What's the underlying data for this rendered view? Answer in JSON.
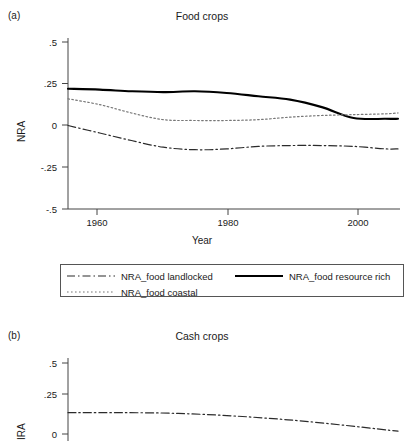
{
  "figure": {
    "panels": [
      {
        "letter": "(a)",
        "title": "Food crops",
        "ylabel": "NRA",
        "xlabel": "Year"
      },
      {
        "letter": "(b)",
        "title": "Cash crops",
        "ylabel": "IRA",
        "xlabel": ""
      }
    ]
  },
  "legend": {
    "entries": [
      {
        "label": "NRA_food landlocked",
        "style": "dash-dot",
        "color": "#2b2b2b"
      },
      {
        "label": "NRA_food resource rich",
        "style": "solid",
        "color": "#000000"
      },
      {
        "label": "NRA_food coastal",
        "style": "dotted",
        "color": "#777777"
      }
    ]
  },
  "axis_a": {
    "yticks": [
      ".5",
      ".25",
      "0",
      "-.25",
      "-.5"
    ],
    "xticks": [
      "1960",
      "1980",
      "2000"
    ]
  },
  "axis_b": {
    "yticks": [
      ".5",
      ".25",
      "0"
    ],
    "xticks": []
  },
  "chart_data": [
    {
      "type": "line",
      "panel": "(a)",
      "title": "Food crops",
      "xlabel": "Year",
      "ylabel": "NRA",
      "xlim": [
        1955,
        2007
      ],
      "ylim": [
        -0.5,
        0.5
      ],
      "ytick_values": [
        0.5,
        0.25,
        0,
        -0.25,
        -0.5
      ],
      "xtick_values": [
        1960,
        1980,
        2000
      ],
      "grid": false,
      "legend_position": "below-plot",
      "x": [
        1955,
        1960,
        1965,
        1970,
        1975,
        1980,
        1985,
        1990,
        1995,
        2000,
        2005,
        2007
      ],
      "series": [
        {
          "name": "NRA_food resource rich",
          "style": "solid",
          "color": "#000000",
          "values": [
            0.22,
            0.215,
            0.205,
            0.2,
            0.205,
            0.195,
            0.175,
            0.155,
            0.11,
            0.045,
            0.04,
            0.04
          ]
        },
        {
          "name": "NRA_food coastal",
          "style": "dotted",
          "color": "#777777",
          "values": [
            0.16,
            0.125,
            0.075,
            0.035,
            0.03,
            0.03,
            0.035,
            0.05,
            0.06,
            0.065,
            0.07,
            0.075
          ]
        },
        {
          "name": "NRA_food landlocked",
          "style": "dash-dot",
          "color": "#2b2b2b",
          "values": [
            0.0,
            -0.045,
            -0.09,
            -0.13,
            -0.145,
            -0.14,
            -0.125,
            -0.12,
            -0.12,
            -0.125,
            -0.14,
            -0.14
          ]
        }
      ]
    },
    {
      "type": "line",
      "panel": "(b)",
      "title": "Cash crops",
      "xlabel": "",
      "ylabel": "IRA",
      "ylim": [
        0,
        0.5
      ],
      "ytick_values": [
        0.5,
        0.25,
        0
      ],
      "grid": false,
      "note": "panel cropped at bottom of screenshot",
      "x": [
        1955,
        1960,
        1965,
        1970
      ],
      "series": [
        {
          "name": "NRA_cash landlocked",
          "style": "dash-dot",
          "color": "#2b2b2b",
          "values": [
            0.15,
            0.145,
            0.1,
            0.02
          ]
        }
      ]
    }
  ]
}
